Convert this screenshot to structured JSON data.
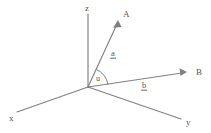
{
  "figure": {
    "type": "vector-diagram",
    "background_color": "#ffffff",
    "line_color": "#808080",
    "text_color": "#555555"
  },
  "axes": [
    {
      "id": "z",
      "label": "z",
      "label_x": 85,
      "label_y": 11,
      "x1": 88,
      "y1": 14,
      "x2": 88,
      "y2": 87
    },
    {
      "id": "x",
      "label": "x",
      "label_x": 9,
      "label_y": 121,
      "x1": 88,
      "y1": 87,
      "x2": 17,
      "y2": 112
    },
    {
      "id": "y",
      "label": "y",
      "label_x": 186,
      "label_y": 125,
      "x1": 88,
      "y1": 87,
      "x2": 181,
      "y2": 119
    }
  ],
  "vectors": [
    {
      "id": "a",
      "label": "a",
      "tip_label": "A",
      "tip_label_x": 123,
      "tip_label_y": 17,
      "label_x": 111,
      "label_y": 56,
      "x1": 88,
      "y1": 87,
      "x2": 118,
      "y2": 22
    },
    {
      "id": "b",
      "label": "b",
      "tip_label": "B",
      "tip_label_x": 196,
      "tip_label_y": 75,
      "label_x": 142,
      "label_y": 88,
      "x1": 88,
      "y1": 87,
      "x2": 186,
      "y2": 72
    }
  ],
  "angle": {
    "label": "u",
    "label_x": 96,
    "label_y": 81,
    "between": [
      "a",
      "b"
    ]
  }
}
